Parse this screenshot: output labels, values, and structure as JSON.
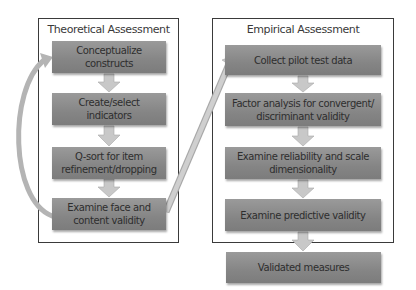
{
  "diagram": {
    "colors": {
      "step_fill": "#8c8c8c",
      "arrow_fill": "#c8c8c8",
      "arrow_stroke": "#a8a8a8",
      "border": "#3a3a3a",
      "text": "#2e2e2e"
    },
    "theoretical": {
      "title": "Theoretical Assessment",
      "steps": [
        {
          "label": "Conceptualize constructs"
        },
        {
          "label": "Create/select indicators"
        },
        {
          "label": "Q-sort for item refinement/dropping"
        },
        {
          "label": "Examine face and content validity"
        }
      ]
    },
    "empirical": {
      "title": "Empirical Assessment",
      "steps": [
        {
          "label": "Collect pilot test data"
        },
        {
          "label": "Factor analysis for convergent/ discriminant validity"
        },
        {
          "label": "Examine reliability and scale dimensionality"
        },
        {
          "label": "Examine predictive validity"
        }
      ]
    },
    "outcome": {
      "label": "Validated measures"
    },
    "connectors": [
      {
        "from": "Examine face and content validity",
        "to": "Conceptualize constructs",
        "type": "feedback-curve"
      },
      {
        "from": "Examine face and content validity",
        "to": "Collect pilot test data",
        "type": "diagonal-arrow"
      }
    ]
  }
}
